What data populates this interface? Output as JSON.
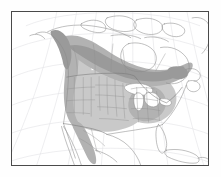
{
  "figure": {
    "type": "range-map",
    "region": "North America",
    "projection": "lambert-conformal-conic",
    "background_color": "#ffffff",
    "frame": {
      "color": "#4a4a4a",
      "width_px": 1,
      "x": 11,
      "y": 11,
      "w": 198,
      "h": 155
    }
  },
  "map_data": {
    "graticule": {
      "visible": true,
      "color": "#e2e2e6",
      "stroke_width": 0.6,
      "meridian_count": 7,
      "parallel_count": 6
    },
    "coastline": {
      "color": "#8a8a8a",
      "stroke_width": 0.55
    },
    "country_borders": {
      "color": "#777777",
      "stroke_width": 0.55
    },
    "state_borders": {
      "color": "#909090",
      "stroke_width": 0.4
    },
    "lakes": {
      "fill": "#ffffff",
      "stroke": "#8a8a8a"
    },
    "range_layers": [
      {
        "name": "range-light",
        "label": "Light shading",
        "fill": "#c9c9c9",
        "opacity": 1
      },
      {
        "name": "range-medium",
        "label": "Medium shading",
        "fill": "#b2b2b2",
        "opacity": 1
      },
      {
        "name": "range-dark",
        "label": "Dark shading",
        "fill": "#9a9a9a",
        "opacity": 1
      }
    ]
  }
}
